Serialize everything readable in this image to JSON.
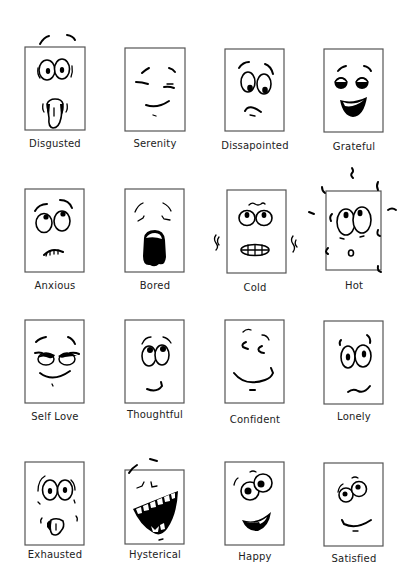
{
  "text_color": "#222222",
  "rows": [
    [
      {
        "label": "Disgusted",
        "icon": "disgusted-face-icon"
      },
      {
        "label": "Serenity",
        "icon": "serenity-face-icon"
      },
      {
        "label": "Dissapointed",
        "icon": "dissapointed-face-icon"
      },
      {
        "label": "Grateful",
        "icon": "grateful-face-icon"
      }
    ],
    [
      {
        "label": "Anxious",
        "icon": "anxious-face-icon"
      },
      {
        "label": "Bored",
        "icon": "bored-face-icon"
      },
      {
        "label": "Cold",
        "icon": "cold-face-icon"
      },
      {
        "label": "Hot",
        "icon": "hot-face-icon"
      }
    ],
    [
      {
        "label": "Self Love",
        "icon": "self-love-face-icon"
      },
      {
        "label": "Thoughtful",
        "icon": "thoughtful-face-icon"
      },
      {
        "label": "Confident",
        "icon": "confident-face-icon"
      },
      {
        "label": "Lonely",
        "icon": "lonely-face-icon"
      }
    ],
    [
      {
        "label": "Exhausted",
        "icon": "exhausted-face-icon"
      },
      {
        "label": "Hysterical",
        "icon": "hysterical-face-icon"
      },
      {
        "label": "Happy",
        "icon": "happy-face-icon"
      },
      {
        "label": "Satisfied",
        "icon": "satisfied-face-icon"
      }
    ]
  ]
}
